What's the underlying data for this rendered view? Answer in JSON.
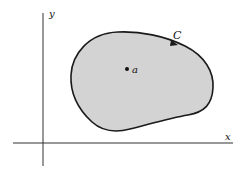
{
  "diagram": {
    "axes": {
      "x_label": "x",
      "y_label": "y"
    },
    "region": {
      "fill_color": "#d3d3d3",
      "stroke_color": "#1a1a1a"
    },
    "curve_label": "C",
    "point_label": "a"
  }
}
